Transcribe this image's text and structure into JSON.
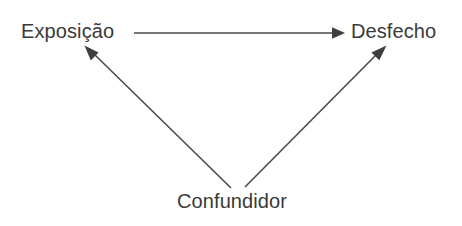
{
  "diagram": {
    "background_color": "#ffffff",
    "line_color": "#4a4a4a",
    "text_color": "#3a3a3a",
    "nodes": [
      {
        "id": "exposure",
        "label": "Exposição",
        "x": 21,
        "y": 21
      },
      {
        "id": "outcome",
        "label": "Desfecho",
        "x": 351,
        "y": 21
      },
      {
        "id": "confounder",
        "label": "Confundidor",
        "x": 177,
        "y": 191
      }
    ],
    "edges": [
      {
        "id": "exposure-to-outcome",
        "from": "exposure",
        "to": "outcome",
        "from_x": 134,
        "from_y": 33,
        "to_x": 343,
        "to_y": 33,
        "arrowhead": "filled-triangle"
      },
      {
        "id": "confounder-to-exposure",
        "from": "confounder",
        "to": "exposure",
        "from_x": 231,
        "from_y": 188,
        "to_x": 85,
        "to_y": 46,
        "arrowhead": "filled-triangle"
      },
      {
        "id": "confounder-to-outcome",
        "from": "confounder",
        "to": "outcome",
        "from_x": 245,
        "from_y": 187,
        "to_x": 386,
        "to_y": 46,
        "arrowhead": "filled-triangle"
      }
    ]
  }
}
